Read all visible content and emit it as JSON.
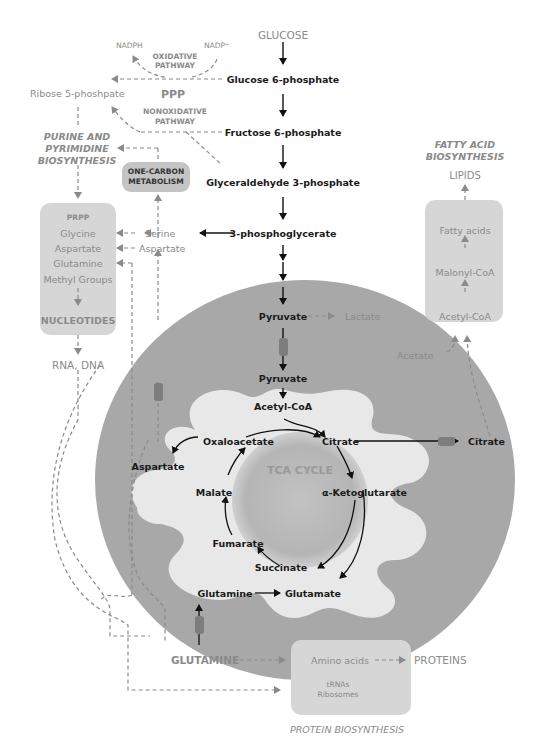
{
  "title": "GLUCOSE",
  "colors": {
    "cytoplasm_bg": "#ffffff",
    "mitochondria_outer": "#a8a8a8",
    "mitochondria_inner": "#e6e6e6",
    "tca_disc": "#b9b9b9",
    "pathway_box": "#d6d6d6",
    "transporter": "#7d7d7d",
    "main_text": "#1a1a1a",
    "side_text": "#8a8a8a"
  },
  "glycolysis": {
    "steps": [
      "Glucose 6-phosphate",
      "Fructose 6-phosphate",
      "Glyceraldehyde 3-phosphate",
      "3-phosphoglycerate",
      "Pyruvate"
    ],
    "lactate": "Lactate"
  },
  "ppp": {
    "label": "PPP",
    "oxidative": "OXIDATIVE PATHWAY",
    "oxidative_l1": "OXIDATIVE",
    "oxidative_l2": "PATHWAY",
    "nonoxidative_l1": "NONOXIDATIVE",
    "nonoxidative_l2": "PATHWAY",
    "nadph": "NADPH",
    "nadp": "NADP⁺",
    "ribose": "Ribose 5-phoshpate"
  },
  "nucleotide": {
    "section_l1": "PURINE AND",
    "section_l2": "PYRIMIDINE",
    "section_l3": "BIOSYNTHESIS",
    "one_carbon_l1": "ONE-CARBON",
    "one_carbon_l2": "METABOLISM",
    "box_items": [
      "PRPP",
      "Glycine",
      "Aspartate",
      "Glutamine",
      "Methyl Groups"
    ],
    "nucleotides": "NUCLEOTIDES",
    "serine": "Serine",
    "aspartate": "Aspartate",
    "output": "RNA, DNA"
  },
  "fatty_acid": {
    "section_l1": "FATTY ACID",
    "section_l2": "BIOSYNTHESIS",
    "output": "LIPIDS",
    "box_items": [
      "Fatty acids",
      "Malonyl-CoA",
      "Acetyl-CoA"
    ],
    "acetate": "Acetate"
  },
  "mitochondria": {
    "pyruvate": "Pyruvate",
    "acetyl_coa": "Acetyl-CoA",
    "tca_label": "TCA CYCLE",
    "cycle": [
      "Citrate",
      "α-Ketoglutarate",
      "Succinate",
      "Fumarate",
      "Malate",
      "Oxaloacetate"
    ],
    "aspartate": "Aspartate",
    "glutamine": "Glutamine",
    "glutamate": "Glutamate",
    "citrate_out": "Citrate"
  },
  "protein": {
    "glutamine_input": "GLUTAMINE",
    "amino_acids": "Amino acids",
    "trnas": "tRNAs",
    "ribosomes": "Ribosomes",
    "output": "PROTEINS",
    "section": "PROTEIN BIOSYNTHESIS"
  }
}
